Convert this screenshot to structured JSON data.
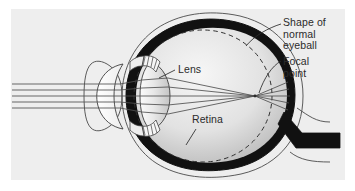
{
  "figure": {
    "panel_background": "#eeeeee",
    "page_background": "#ffffff",
    "ink_color": "#2b2b2b"
  },
  "labels": {
    "shape_of_normal_eyeball": "Shape of\nnormal\neyeball",
    "focal_point": "Focal\npoint",
    "lens": "Lens",
    "retina": "Retina"
  },
  "diagram": {
    "parts": [
      "sclera-outline",
      "retina-band",
      "vitreous-body",
      "cornea",
      "lens",
      "ciliary-body-upper",
      "ciliary-body-lower",
      "optic-nerve",
      "normal-eyeball-dashed-outline",
      "light-rays",
      "focal-point-marker"
    ],
    "light_ray_count": 5,
    "focal_point": {
      "x": 255,
      "y": 96
    },
    "colors": {
      "retina_band": "#111111",
      "optic_nerve": "#111111",
      "sclera_stroke": "#3a3a3a",
      "vitreous_fill_light": "#f2f2f2",
      "vitreous_fill_dark": "#b9b9b9",
      "cornea_fill": "#fdfdfd",
      "lens_fill_light": "#fbfbfb",
      "lens_fill_dark": "#c9c9c9",
      "ray_stroke": "#4d4d4d",
      "dashed_outline": "#333333"
    }
  }
}
